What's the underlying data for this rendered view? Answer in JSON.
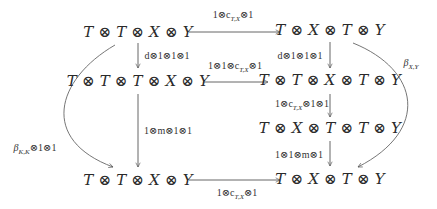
{
  "diagram": {
    "type": "commutative-diagram",
    "nodes": {
      "top_left": "T ⊗ T ⊗ X ⊗ Y",
      "top_right": "T ⊗ X ⊗ T ⊗ Y",
      "mid_left": "T ⊗ T ⊗ T ⊗ X ⊗ Y",
      "mid_right": "T ⊗ T ⊗ X ⊗ T ⊗ Y",
      "low_right": "T ⊗ X ⊗ T ⊗ T ⊗ Y",
      "bottom_left": "T ⊗ T ⊗ X ⊗ Y",
      "bottom_right": "T ⊗ X ⊗ T ⊗ Y"
    },
    "arrows": {
      "top": "1⊗c",
      "top_sub": "T,X",
      "top_tail": "⊗1",
      "left_d": "d⊗1⊗1⊗1",
      "right_d": "d⊗1⊗1⊗1",
      "mid": "1⊗1⊗c",
      "mid_sub": "T,X",
      "mid_tail": "⊗1",
      "right_c": "1⊗c",
      "right_c_sub": "T,X",
      "right_c_tail": "⊗1⊗1",
      "left_m": "1⊗m⊗1⊗1",
      "right_m": "1⊗1⊗m⊗1",
      "bottom": "1⊗c",
      "bottom_sub": "T,X",
      "bottom_tail": "⊗1",
      "left_curve": "β",
      "left_curve_sub": "K,K",
      "left_curve_tail": "⊗1⊗1",
      "right_curve": "β",
      "right_curve_sub": "X,Y"
    },
    "colors": {
      "stroke": "#555555",
      "text": "#2a2a2a"
    }
  }
}
